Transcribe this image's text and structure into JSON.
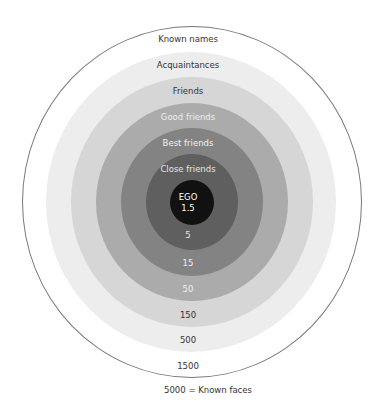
{
  "diagram": {
    "rings": [
      {
        "name": "Known names",
        "count": "1500",
        "color": "#ffffff",
        "text_color": "#333333"
      },
      {
        "name": "Acquaintances",
        "count": "500",
        "color": "#ededed",
        "text_color": "#333333"
      },
      {
        "name": "Friends",
        "count": "150",
        "color": "#d6d6d6",
        "text_color": "#333333"
      },
      {
        "name": "Good friends",
        "count": "50",
        "color": "#ababab",
        "text_color": "#eeeeee"
      },
      {
        "name": "Best friends",
        "count": "15",
        "color": "#838383",
        "text_color": "#f2f2f2"
      },
      {
        "name": "Close friends",
        "count": "5",
        "color": "#5f5f5f",
        "text_color": "#e6e6e6"
      }
    ],
    "ego": {
      "label": "EGO",
      "value": "1.5",
      "color": "#111111",
      "text_color": "#ffffff"
    },
    "outer_caption": "5000 = Known faces"
  }
}
